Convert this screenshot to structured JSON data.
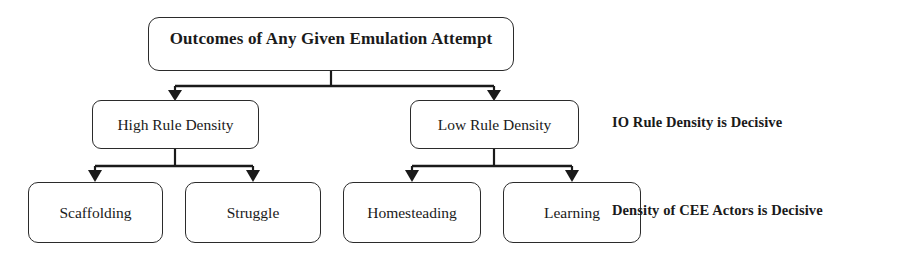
{
  "diagram": {
    "title_box": {
      "label": "Outcomes of Any Given Emulation Attempt"
    },
    "level2": [
      {
        "label": "High Rule Density"
      },
      {
        "label": "Low Rule Density"
      }
    ],
    "level3": [
      {
        "label": "Scaffolding"
      },
      {
        "label": "Struggle"
      },
      {
        "label": "Homesteading"
      },
      {
        "label": "Learning"
      }
    ],
    "annotations": [
      {
        "label": "IO Rule Density is Decisive"
      },
      {
        "label": "Density of CEE Actors is Decisive"
      }
    ],
    "style": {
      "box_border_color": "#2b2b2b",
      "box_fill_color": "#ffffff",
      "connector_color": "#1a1a1a",
      "text_color": "#1a1a1a",
      "background_color": "#ffffff"
    }
  }
}
